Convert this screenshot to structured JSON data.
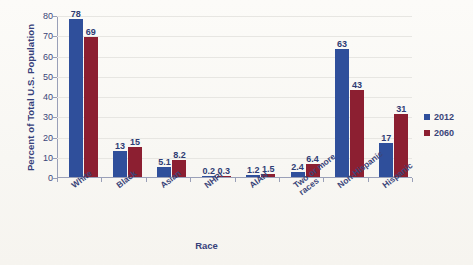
{
  "chart_data": {
    "type": "bar",
    "title": "",
    "xlabel": "Race",
    "ylabel": "Percent of Total U.S. Population",
    "ylim": [
      0,
      80
    ],
    "yticks": [
      0,
      10,
      20,
      30,
      40,
      50,
      60,
      70,
      80
    ],
    "grid": true,
    "legend_position": "right",
    "categories": [
      "White",
      "Black",
      "Asian",
      "NHPI",
      "AIAN",
      "Two or more races",
      "Non-Hispanic",
      "Hispanic"
    ],
    "series": [
      {
        "name": "2012",
        "color": "#2f4f9b",
        "values": [
          78,
          13,
          5.1,
          0.2,
          1.2,
          2.4,
          63,
          17
        ],
        "labels": [
          "78",
          "13",
          "5.1",
          "0.2",
          "1.2",
          "2.4",
          "63",
          "17"
        ]
      },
      {
        "name": "2060",
        "color": "#8c1f31",
        "values": [
          69,
          15,
          8.2,
          0.3,
          1.5,
          6.4,
          43,
          31
        ],
        "labels": [
          "69",
          "15",
          "8.2",
          "0.3",
          "1.5",
          "6.4",
          "43",
          "31"
        ]
      }
    ]
  },
  "axes": {
    "y_title": "Percent of Total U.S. Population",
    "x_title": "Race",
    "y_tick_labels": [
      "80",
      "70",
      "60",
      "50",
      "40",
      "30",
      "20",
      "10",
      "0"
    ]
  },
  "legend": {
    "entries": [
      {
        "label": "2012",
        "color": "#2f4f9b"
      },
      {
        "label": "2060",
        "color": "#8c1f31"
      }
    ]
  }
}
